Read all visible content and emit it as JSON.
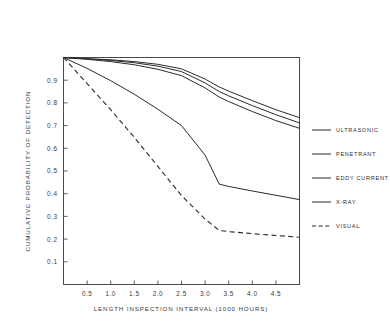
{
  "chart_data": {
    "type": "line",
    "title": "",
    "xlabel": "LENGTH INSPECTION INTERVAL (1000 HOURS)",
    "ylabel": "CUMULATIVE PROBABILITY OF DETECTION",
    "xlim": [
      0.0,
      5.0
    ],
    "ylim": [
      0.0,
      1.0
    ],
    "grid": false,
    "legend_position": "right",
    "xticks": [
      "0.5",
      "1.0",
      "1.5",
      "2.0",
      "2.5",
      "3.0",
      "3.5",
      "4.0",
      "4.5"
    ],
    "xtick_values": [
      0.5,
      1.0,
      1.5,
      2.0,
      2.5,
      3.0,
      3.5,
      4.0,
      4.5
    ],
    "yticks": [
      "0.1",
      "0.2",
      "0.3",
      "0.4",
      "0.5",
      "0.6",
      "0.7",
      "0.8",
      "0.9"
    ],
    "ytick_values": [
      0.1,
      0.2,
      0.3,
      0.4,
      0.5,
      0.6,
      0.7,
      0.8,
      0.9
    ],
    "x": [
      0.0,
      0.5,
      1.0,
      1.5,
      2.0,
      2.5,
      3.0,
      3.3,
      3.5,
      4.0,
      4.5,
      5.0
    ],
    "series": [
      {
        "name": "ULTRASONIC",
        "style": "solid",
        "color": "#2b2b2b",
        "values": [
          1.0,
          0.995,
          0.99,
          0.982,
          0.97,
          0.95,
          0.905,
          0.87,
          0.852,
          0.81,
          0.77,
          0.735
        ]
      },
      {
        "name": "PENETRANT",
        "style": "solid",
        "color": "#2b2b2b",
        "values": [
          1.0,
          0.994,
          0.987,
          0.977,
          0.962,
          0.938,
          0.888,
          0.85,
          0.831,
          0.788,
          0.748,
          0.712
        ]
      },
      {
        "name": "EDDY CURRENT",
        "style": "solid",
        "color": "#2b2b2b",
        "values": [
          1.0,
          0.992,
          0.982,
          0.968,
          0.948,
          0.92,
          0.866,
          0.826,
          0.806,
          0.762,
          0.722,
          0.688
        ]
      },
      {
        "name": "X-RAY",
        "style": "solid",
        "color": "#2b2b2b",
        "values": [
          1.0,
          0.952,
          0.898,
          0.838,
          0.772,
          0.7,
          0.57,
          0.442,
          0.432,
          0.412,
          0.393,
          0.374
        ]
      },
      {
        "name": "VISUAL",
        "style": "dashed",
        "color": "#2b2b2b",
        "values": [
          1.0,
          0.885,
          0.77,
          0.648,
          0.52,
          0.392,
          0.288,
          0.238,
          0.233,
          0.224,
          0.216,
          0.208
        ]
      }
    ]
  },
  "legend": {
    "items": [
      {
        "label": "ULTRASONIC"
      },
      {
        "label": "PENETRANT"
      },
      {
        "label": "EDDY CURRENT"
      },
      {
        "label": "X-RAY"
      },
      {
        "label": "VISUAL"
      }
    ]
  }
}
